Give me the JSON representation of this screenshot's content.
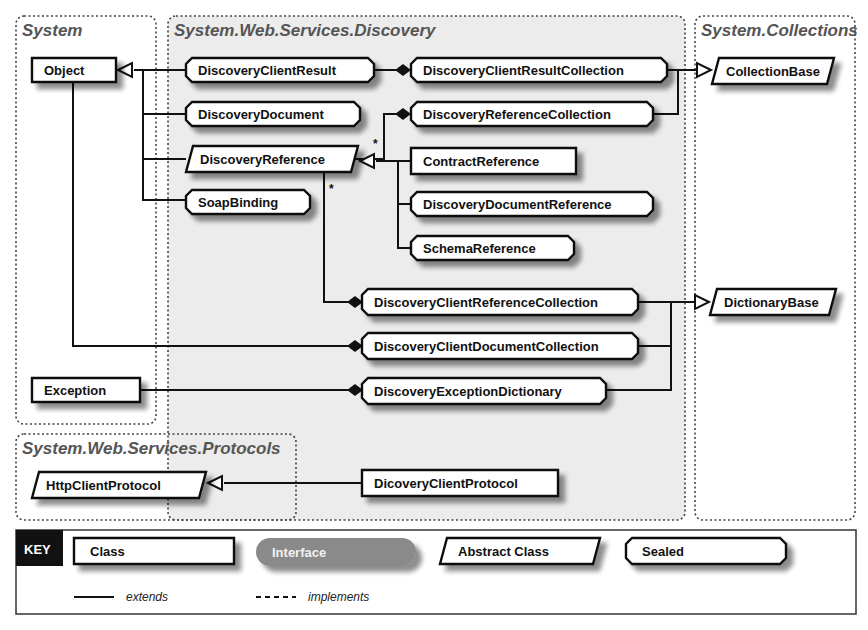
{
  "packages": [
    {
      "id": "system",
      "title": "System",
      "x": 16,
      "y": 16,
      "w": 140,
      "h": 408,
      "shaded": false
    },
    {
      "id": "discovery",
      "title": "System.Web.Services.Discovery",
      "x": 168,
      "y": 16,
      "w": 517,
      "h": 504,
      "shaded": true
    },
    {
      "id": "collections",
      "title": "System.Collections",
      "x": 695,
      "y": 16,
      "w": 160,
      "h": 504,
      "shaded": false
    },
    {
      "id": "protocols",
      "title": "System.Web.Services.Protocols",
      "x": 16,
      "y": 434,
      "w": 280,
      "h": 86,
      "shaded": false
    }
  ],
  "nodes": [
    {
      "id": "Object",
      "label": "Object",
      "kind": "class",
      "x": 32,
      "y": 58,
      "w": 84,
      "h": 24
    },
    {
      "id": "Exception",
      "label": "Exception",
      "kind": "class",
      "x": 32,
      "y": 378,
      "w": 108,
      "h": 24
    },
    {
      "id": "DiscoveryClientResult",
      "label": "DiscoveryClientResult",
      "kind": "sealed",
      "x": 186,
      "y": 58,
      "w": 188,
      "h": 24
    },
    {
      "id": "DiscoveryDocument",
      "label": "DiscoveryDocument",
      "kind": "sealed",
      "x": 186,
      "y": 102,
      "w": 174,
      "h": 24
    },
    {
      "id": "DiscoveryReference",
      "label": "DiscoveryReference",
      "kind": "abstract",
      "x": 186,
      "y": 146,
      "w": 172,
      "h": 26
    },
    {
      "id": "SoapBinding",
      "label": "SoapBinding",
      "kind": "sealed",
      "x": 186,
      "y": 190,
      "w": 124,
      "h": 24
    },
    {
      "id": "DiscoveryClientResultCollection",
      "label": "DiscoveryClientResultCollection",
      "kind": "sealed",
      "x": 411,
      "y": 58,
      "w": 256,
      "h": 24
    },
    {
      "id": "DiscoveryReferenceCollection",
      "label": "DiscoveryReferenceCollection",
      "kind": "sealed",
      "x": 411,
      "y": 102,
      "w": 242,
      "h": 24
    },
    {
      "id": "ContractReference",
      "label": "ContractReference",
      "kind": "class",
      "x": 411,
      "y": 148,
      "w": 165,
      "h": 26
    },
    {
      "id": "DiscoveryDocumentReference",
      "label": "DiscoveryDocumentReference",
      "kind": "sealed",
      "x": 411,
      "y": 192,
      "w": 242,
      "h": 24
    },
    {
      "id": "SchemaReference",
      "label": "SchemaReference",
      "kind": "sealed",
      "x": 411,
      "y": 236,
      "w": 163,
      "h": 24
    },
    {
      "id": "DiscoveryClientReferenceCollection",
      "label": "DiscoveryClientReferenceCollection",
      "kind": "sealed",
      "x": 362,
      "y": 289,
      "w": 276,
      "h": 26
    },
    {
      "id": "DiscoveryClientDocumentCollection",
      "label": "DiscoveryClientDocumentCollection",
      "kind": "sealed",
      "x": 362,
      "y": 333,
      "w": 276,
      "h": 26
    },
    {
      "id": "DiscoveryExceptionDictionary",
      "label": "DiscoveryExceptionDictionary",
      "kind": "sealed",
      "x": 362,
      "y": 378,
      "w": 244,
      "h": 26
    },
    {
      "id": "DicoveryClientProtocol",
      "label": "DicoveryClientProtocol",
      "kind": "class",
      "x": 362,
      "y": 470,
      "w": 196,
      "h": 26
    },
    {
      "id": "CollectionBase",
      "label": "CollectionBase",
      "kind": "abstract",
      "x": 712,
      "y": 58,
      "w": 122,
      "h": 26
    },
    {
      "id": "DictionaryBase",
      "label": "DictionaryBase",
      "kind": "abstract",
      "x": 710,
      "y": 289,
      "w": 126,
      "h": 26
    },
    {
      "id": "HttpClientProtocol",
      "label": "HttpClientProtocol",
      "kind": "abstract",
      "x": 32,
      "y": 472,
      "w": 174,
      "h": 26
    }
  ],
  "edges": [
    {
      "type": "extends",
      "points": [
        [
          186,
          70
        ],
        [
          134,
          70
        ]
      ],
      "arrow_at": [
        118,
        70
      ]
    },
    {
      "type": "line",
      "points": [
        [
          143,
          70
        ],
        [
          143,
          200
        ],
        [
          186,
          200
        ]
      ]
    },
    {
      "type": "line",
      "points": [
        [
          143,
          114
        ],
        [
          186,
          114
        ]
      ]
    },
    {
      "type": "line",
      "points": [
        [
          143,
          159
        ],
        [
          186,
          159
        ]
      ]
    },
    {
      "type": "aggregation",
      "points": [
        [
          374,
          70
        ],
        [
          396,
          70
        ]
      ],
      "diamond_at": [
        403,
        70
      ]
    },
    {
      "type": "aggregation",
      "points": [
        [
          350,
          159
        ],
        [
          384,
          159
        ],
        [
          384,
          114
        ],
        [
          396,
          114
        ]
      ],
      "diamond_at": [
        403,
        114
      ]
    },
    {
      "type": "extends",
      "points": [
        [
          411,
          161
        ],
        [
          376,
          161
        ]
      ],
      "arrow_at": [
        360,
        161
      ]
    },
    {
      "type": "line",
      "points": [
        [
          398,
          161
        ],
        [
          398,
          248
        ],
        [
          411,
          248
        ]
      ]
    },
    {
      "type": "line",
      "points": [
        [
          398,
          204
        ],
        [
          411,
          204
        ]
      ]
    },
    {
      "type": "aggregation",
      "points": [
        [
          324,
          172
        ],
        [
          324,
          302
        ],
        [
          348,
          302
        ]
      ],
      "diamond_at": [
        355,
        302
      ]
    },
    {
      "type": "aggregation",
      "points": [
        [
          73,
          82
        ],
        [
          73,
          346
        ],
        [
          348,
          346
        ]
      ],
      "diamond_at": [
        355,
        346
      ]
    },
    {
      "type": "aggregation",
      "points": [
        [
          140,
          390
        ],
        [
          348,
          390
        ]
      ],
      "diamond_at": [
        355,
        390
      ]
    },
    {
      "type": "extends",
      "points": [
        [
          667,
          70
        ],
        [
          697,
          70
        ]
      ],
      "arrow_at": [
        711,
        70
      ]
    },
    {
      "type": "line",
      "points": [
        [
          653,
          114
        ],
        [
          678,
          114
        ],
        [
          678,
          70
        ]
      ]
    },
    {
      "type": "extends",
      "points": [
        [
          638,
          302
        ],
        [
          695,
          302
        ]
      ],
      "arrow_at": [
        709,
        302
      ]
    },
    {
      "type": "line",
      "points": [
        [
          638,
          346
        ],
        [
          671,
          346
        ]
      ]
    },
    {
      "type": "line",
      "points": [
        [
          606,
          390
        ],
        [
          671,
          390
        ],
        [
          671,
          302
        ]
      ]
    },
    {
      "type": "extends",
      "points": [
        [
          362,
          483
        ],
        [
          224,
          483
        ]
      ],
      "arrow_at": [
        208,
        483
      ]
    }
  ],
  "multiplicities": [
    {
      "label": "*",
      "x": 373,
      "y": 148
    },
    {
      "label": "*",
      "x": 329,
      "y": 193
    }
  ],
  "key": {
    "title": "KEY",
    "items": [
      {
        "label": "Class",
        "kind": "class"
      },
      {
        "label": "Interface",
        "kind": "interface"
      },
      {
        "label": "Abstract Class",
        "kind": "abstract"
      },
      {
        "label": "Sealed",
        "kind": "sealed"
      }
    ],
    "lines": [
      {
        "label": "extends",
        "style": "solid"
      },
      {
        "label": "implements",
        "style": "dashed"
      }
    ]
  },
  "colors": {
    "package_border": "#444444",
    "package_shade": "#ececec",
    "node_fill": "#ffffff",
    "node_stroke": "#111111",
    "shadow": "#9a9a9a",
    "interface_fill": "#8a8a8a",
    "key_title_bg": "#111111"
  }
}
